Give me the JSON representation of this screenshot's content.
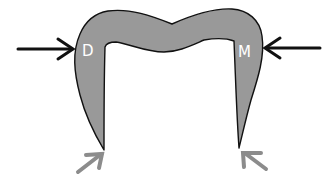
{
  "diagram": {
    "labels": {
      "left": "D",
      "right": "M"
    },
    "colors": {
      "shape_fill": "#999999",
      "shape_stroke": "#111111",
      "force_arrow": "#111111",
      "support_arrow": "#8c8c8c",
      "label": "#ffffff"
    }
  }
}
